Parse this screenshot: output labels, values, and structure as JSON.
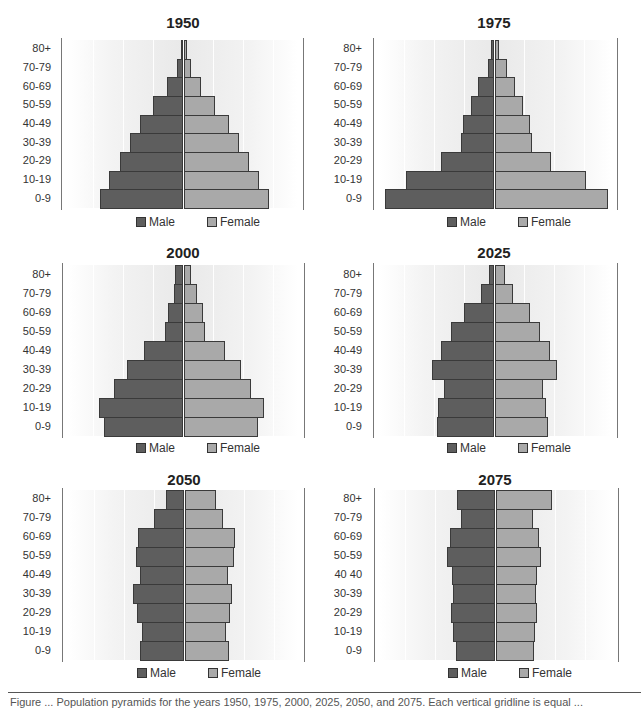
{
  "chart_data": [
    {
      "type": "bar",
      "subtype": "population-pyramid",
      "title": "1950",
      "categories": [
        "80+",
        "70-79",
        "60-69",
        "50-59",
        "40-49",
        "30-39",
        "20-29",
        "10-19",
        "0-9"
      ],
      "series": [
        {
          "name": "Male",
          "values": [
            2.5,
            6,
            16,
            30.5,
            43.5,
            53.5,
            63.5,
            74.5,
            83.5
          ]
        },
        {
          "name": "Female",
          "values": [
            2.5,
            7,
            17,
            30.5,
            44.5,
            54.5,
            64.5,
            74.5,
            84.5
          ]
        }
      ],
      "xlabel": "",
      "ylabel": "",
      "grid": true,
      "legend_position": "bottom",
      "units": "relative (pixel half-width; gridlines every 30)"
    },
    {
      "type": "bar",
      "subtype": "population-pyramid",
      "title": "1975",
      "categories": [
        "80+",
        "70-79",
        "60-69",
        "50-59",
        "40-49",
        "30-39",
        "20-29",
        "10-19",
        "0-9"
      ],
      "series": [
        {
          "name": "Male",
          "values": [
            3,
            6.5,
            16.5,
            23.5,
            31.5,
            33.5,
            53.5,
            88.5,
            109.5
          ]
        },
        {
          "name": "Female",
          "values": [
            3.5,
            11.5,
            20,
            27.5,
            34.5,
            36.5,
            55.5,
            90.5,
            112.5
          ]
        }
      ],
      "xlabel": "",
      "ylabel": "",
      "grid": true,
      "legend_position": "bottom"
    },
    {
      "type": "bar",
      "subtype": "population-pyramid",
      "title": "2000",
      "categories": [
        "80+",
        "70-79",
        "60-69",
        "50-59",
        "40-49",
        "30-39",
        "20-29",
        "10-19",
        "0-9"
      ],
      "series": [
        {
          "name": "Male",
          "values": [
            8,
            9,
            15,
            18.3,
            39,
            56,
            69,
            84,
            79.3
          ]
        },
        {
          "name": "Female",
          "values": [
            7,
            12.7,
            19.3,
            20.7,
            41,
            57,
            67.3,
            80.3,
            74
          ]
        }
      ],
      "xlabel": "",
      "ylabel": "",
      "grid": true,
      "legend_position": "bottom"
    },
    {
      "type": "bar",
      "subtype": "population-pyramid",
      "title": "2025",
      "categories": [
        "80+",
        "70-79",
        "60-69",
        "50-59",
        "40-49",
        "30-39",
        "20-29",
        "10-19",
        "0-9"
      ],
      "series": [
        {
          "name": "Male",
          "values": [
            5,
            13,
            30,
            42.7,
            53,
            62.3,
            50,
            55.7,
            57
          ]
        },
        {
          "name": "Female",
          "values": [
            10.3,
            18.3,
            35.3,
            45,
            54.7,
            62,
            47.7,
            51.3,
            53.3
          ]
        }
      ],
      "xlabel": "",
      "ylabel": "",
      "grid": true,
      "legend_position": "bottom"
    },
    {
      "type": "bar",
      "subtype": "population-pyramid",
      "title": "2050",
      "categories": [
        "80+",
        "70-79",
        "60-69",
        "50-59",
        "40-49",
        "30-39",
        "20-29",
        "10-19",
        "0-9"
      ],
      "series": [
        {
          "name": "Male",
          "values": [
            18.3,
            30,
            45.7,
            48,
            44,
            50.7,
            47.3,
            42.3,
            44.3
          ]
        },
        {
          "name": "Female",
          "values": [
            31,
            38,
            50.3,
            49,
            43.3,
            47,
            44.7,
            41,
            44
          ]
        }
      ],
      "xlabel": "",
      "ylabel": "",
      "grid": true,
      "legend_position": "bottom"
    },
    {
      "type": "bar",
      "subtype": "population-pyramid",
      "title": "2075",
      "categories": [
        "80+",
        "70-79",
        "60-69",
        "50-59",
        "40 40",
        "30-39",
        "20-29",
        "10-19",
        "0-9"
      ],
      "series": [
        {
          "name": "Male",
          "values": [
            38,
            34.3,
            45.3,
            48.3,
            43.3,
            42.3,
            44,
            41.7,
            39.3
          ]
        },
        {
          "name": "Female",
          "values": [
            56.3,
            37.3,
            43,
            44.7,
            40.7,
            40,
            41.3,
            39,
            38
          ]
        }
      ],
      "xlabel": "",
      "ylabel": "",
      "grid": true,
      "legend_position": "bottom"
    }
  ],
  "legend": {
    "male": "Male",
    "female": "Female"
  },
  "colors": {
    "male": "#5e5e5e",
    "female": "#a9a9a9",
    "border": "#3a3a3a",
    "axis": "#777777"
  },
  "caption": "Figure ... Population pyramids for the years 1950, 1975, 2000, 2025, 2050, and 2075. Each vertical gridline is equal ..."
}
